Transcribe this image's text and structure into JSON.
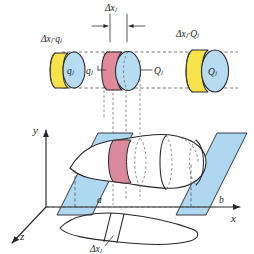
{
  "figure": {
    "background_color": "#ffffff"
  },
  "colors": {
    "disk_face_blue": "#b7dcf2",
    "disk_side_yellow": "#f6e34a",
    "disk_side_pink": "#e08a9c",
    "plane_blue": "#a8d4ef",
    "outline": "#26262b",
    "dashed": "#55555c",
    "label_text": "#1a1a1a"
  },
  "labels": {
    "delta_x_top": "Δxⱼ",
    "delta_x_bottom": "Δxⱼ",
    "left_disk_top": "Δxⱼ·qⱼ",
    "left_disk_inner": "qⱼ",
    "right_disk_top": "Δxⱼ·Qⱼ",
    "right_disk_inner": "Qⱼ",
    "center_left_callout": "qⱼ",
    "center_right_callout": "Qⱼ",
    "axis_x": "x",
    "axis_y": "y",
    "axis_z": "z",
    "bound_a": "a",
    "bound_b": "b"
  },
  "elements": {
    "left_disk": {
      "name": "inner-radius-disk",
      "side_color": "#f6e34a",
      "face_color": "#b7dcf2"
    },
    "center_disk": {
      "name": "slice-disk",
      "side_color": "#e08a9c",
      "face_color": "#b7dcf2"
    },
    "right_disk": {
      "name": "outer-radius-disk",
      "side_color": "#f6e34a",
      "face_color": "#b7dcf2"
    },
    "left_plane": {
      "name": "cutting-plane-a",
      "color": "#a8d4ef"
    },
    "right_plane": {
      "name": "cutting-plane-b",
      "color": "#a8d4ef"
    },
    "solid": {
      "name": "solid-of-revolution",
      "color": "#ffffff"
    },
    "slice_band": {
      "name": "highlighted-slice",
      "color": "#e08a9c"
    }
  }
}
